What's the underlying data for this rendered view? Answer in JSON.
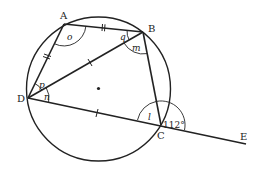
{
  "diagram": {
    "type": "cyclic-quadrilateral",
    "points": {
      "A": {
        "label": "A",
        "x": 64,
        "y": 24
      },
      "B": {
        "label": "B",
        "x": 143,
        "y": 32
      },
      "C": {
        "label": "C",
        "x": 161,
        "y": 125
      },
      "D": {
        "label": "D",
        "x": 28,
        "y": 98
      },
      "E": {
        "label": "E",
        "x": 246,
        "y": 144
      }
    },
    "circle": {
      "cx": 98.5,
      "cy": 89,
      "r": 72,
      "center_dot": true
    },
    "angles": {
      "o": {
        "label": "o",
        "vertex": "A"
      },
      "q": {
        "label": "q",
        "vertex": "B"
      },
      "m": {
        "label": "m",
        "vertex": "B"
      },
      "p": {
        "label": "p",
        "vertex": "D"
      },
      "n": {
        "label": "n",
        "vertex": "D"
      },
      "l": {
        "label": "l",
        "vertex": "C"
      },
      "exterior": {
        "label": "112°",
        "vertex": "C"
      }
    },
    "equal_marks": {
      "double": [
        "AB",
        "AD"
      ],
      "single": [
        "DB",
        "DC"
      ]
    },
    "stroke_color": "#222222"
  }
}
